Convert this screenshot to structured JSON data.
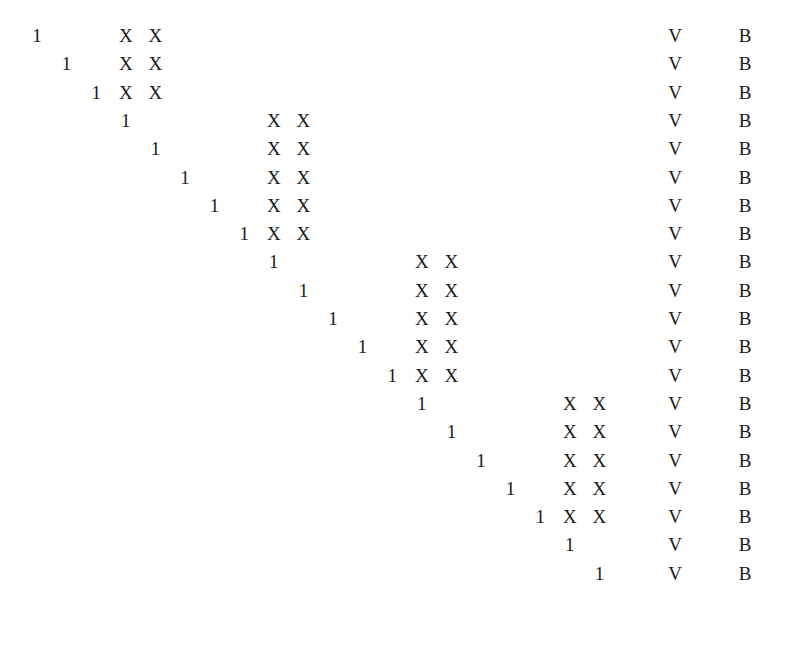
{
  "matrix": {
    "rows": 20,
    "grid": {
      "origin_x": 37,
      "col_pitch": 29.6,
      "origin_y": 26,
      "row_pitch": 28.3,
      "v_x": 675,
      "b_x": 745
    },
    "one_symbol": "1",
    "x_symbol": "X",
    "v_symbol": "V",
    "b_symbol": "B",
    "entries": [
      {
        "one_col": 0,
        "x_cols": [
          3,
          4
        ]
      },
      {
        "one_col": 1,
        "x_cols": [
          3,
          4
        ]
      },
      {
        "one_col": 2,
        "x_cols": [
          3,
          4
        ]
      },
      {
        "one_col": 3,
        "x_cols": [
          8,
          9
        ]
      },
      {
        "one_col": 4,
        "x_cols": [
          8,
          9
        ]
      },
      {
        "one_col": 5,
        "x_cols": [
          8,
          9
        ]
      },
      {
        "one_col": 6,
        "x_cols": [
          8,
          9
        ]
      },
      {
        "one_col": 7,
        "x_cols": [
          8,
          9
        ]
      },
      {
        "one_col": 8,
        "x_cols": [
          13,
          14
        ]
      },
      {
        "one_col": 9,
        "x_cols": [
          13,
          14
        ]
      },
      {
        "one_col": 10,
        "x_cols": [
          13,
          14
        ]
      },
      {
        "one_col": 11,
        "x_cols": [
          13,
          14
        ]
      },
      {
        "one_col": 12,
        "x_cols": [
          13,
          14
        ]
      },
      {
        "one_col": 13,
        "x_cols": [
          18,
          19
        ]
      },
      {
        "one_col": 14,
        "x_cols": [
          18,
          19
        ]
      },
      {
        "one_col": 15,
        "x_cols": [
          18,
          19
        ]
      },
      {
        "one_col": 16,
        "x_cols": [
          18,
          19
        ]
      },
      {
        "one_col": 17,
        "x_cols": [
          18,
          19
        ]
      },
      {
        "one_col": 18,
        "x_cols": []
      },
      {
        "one_col": 19,
        "x_cols": []
      }
    ]
  }
}
